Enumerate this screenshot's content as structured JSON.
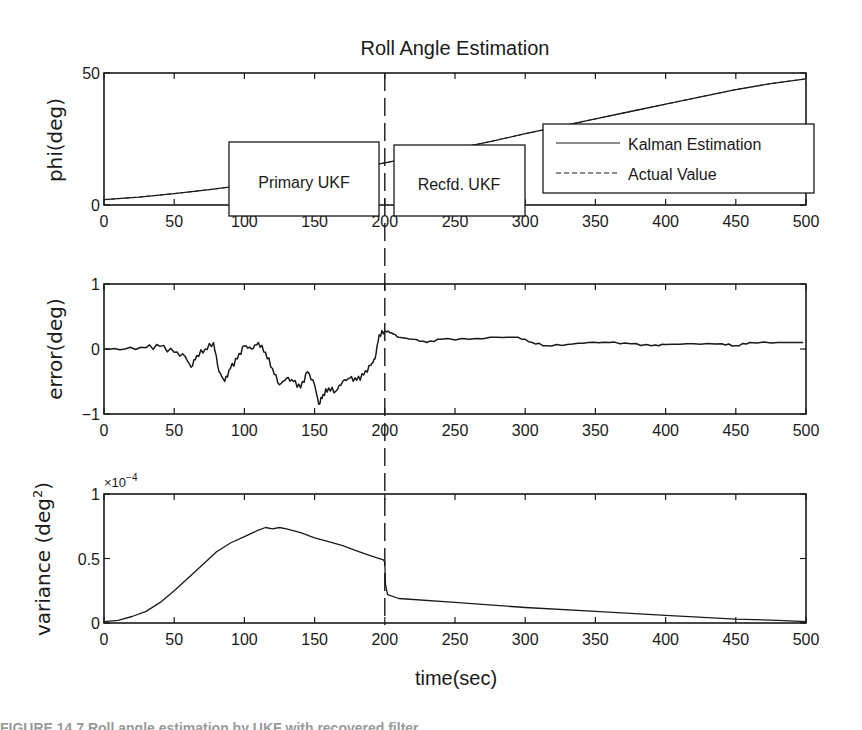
{
  "chart_data": [
    {
      "type": "line",
      "title": "Roll Angle Estimation",
      "xlabel": "",
      "ylabel": "phi(deg)",
      "xlim": [
        0,
        500
      ],
      "ylim": [
        0,
        50
      ],
      "xticks": [
        0,
        50,
        100,
        150,
        200,
        250,
        300,
        350,
        400,
        450,
        500
      ],
      "yticks": [
        0,
        50
      ],
      "grid": false,
      "legend": {
        "position": "right-center",
        "entries": [
          {
            "label": "Kalman Estimation",
            "style": "solid"
          },
          {
            "label": "Actual Value",
            "style": "dashed"
          }
        ]
      },
      "annotations": [
        {
          "text": "Primary UKF",
          "x_range": [
            90,
            195
          ],
          "y_range": [
            28,
            43
          ]
        },
        {
          "text": "Recfd. UKF",
          "x_range": [
            205,
            297
          ],
          "y_range": [
            28,
            42
          ]
        }
      ],
      "vline": {
        "x": 200,
        "style": "dashed"
      },
      "series": [
        {
          "name": "Kalman Estimation",
          "x": [
            0,
            25,
            50,
            75,
            100,
            125,
            150,
            175,
            200,
            225,
            250,
            275,
            300,
            325,
            350,
            375,
            400,
            425,
            450,
            475,
            500
          ],
          "values": [
            2,
            3,
            4.3,
            5.8,
            7.5,
            9.3,
            11.2,
            13.4,
            16,
            18.6,
            21.3,
            24,
            27,
            29.8,
            32.6,
            35.4,
            38.2,
            41,
            43.7,
            46,
            47.8
          ]
        }
      ]
    },
    {
      "type": "line",
      "title": "",
      "xlabel": "",
      "ylabel": "error(deg)",
      "xlim": [
        0,
        500
      ],
      "ylim": [
        -1,
        1
      ],
      "xticks": [
        0,
        50,
        100,
        150,
        200,
        250,
        300,
        350,
        400,
        450,
        500
      ],
      "yticks": [
        -1,
        0,
        1
      ],
      "grid": false,
      "vline": {
        "x": 200,
        "style": "dashed"
      },
      "series": [
        {
          "name": "error",
          "x": [
            0,
            15,
            30,
            40,
            50,
            58,
            62,
            66,
            72,
            78,
            82,
            86,
            90,
            95,
            100,
            105,
            110,
            115,
            120,
            125,
            130,
            135,
            140,
            145,
            150,
            153,
            156,
            160,
            165,
            170,
            175,
            180,
            185,
            190,
            193,
            196,
            200,
            205,
            210,
            220,
            230,
            240,
            260,
            280,
            295,
            305,
            315,
            330,
            345,
            360,
            375,
            390,
            400,
            420,
            440,
            450,
            460,
            480,
            498
          ],
          "values": [
            0,
            0,
            0.02,
            0.04,
            -0.05,
            -0.12,
            -0.28,
            -0.1,
            0.0,
            0.1,
            -0.35,
            -0.5,
            -0.3,
            -0.15,
            0.05,
            0.0,
            0.1,
            -0.05,
            -0.3,
            -0.55,
            -0.45,
            -0.5,
            -0.6,
            -0.35,
            -0.55,
            -0.85,
            -0.7,
            -0.6,
            -0.65,
            -0.5,
            -0.45,
            -0.48,
            -0.4,
            -0.25,
            -0.15,
            0.22,
            0.28,
            0.25,
            0.18,
            0.15,
            0.1,
            0.15,
            0.15,
            0.18,
            0.18,
            0.1,
            0.05,
            0.07,
            0.1,
            0.1,
            0.08,
            0.05,
            0.07,
            0.08,
            0.08,
            0.05,
            0.1,
            0.1,
            0.1
          ]
        }
      ]
    },
    {
      "type": "line",
      "title": "",
      "xlabel": "time(sec)",
      "ylabel": "variance (deg2)",
      "y_multiplier": "×10-4",
      "xlim": [
        0,
        500
      ],
      "ylim": [
        0,
        1
      ],
      "xticks": [
        0,
        50,
        100,
        150,
        200,
        250,
        300,
        350,
        400,
        450,
        500
      ],
      "yticks": [
        0,
        0.5,
        1
      ],
      "grid": false,
      "vline": {
        "x": 200,
        "style": "dashed"
      },
      "series": [
        {
          "name": "variance",
          "x": [
            0,
            10,
            20,
            30,
            40,
            50,
            60,
            70,
            80,
            90,
            100,
            110,
            115,
            120,
            125,
            130,
            140,
            150,
            160,
            170,
            180,
            190,
            199,
            200,
            200.5,
            202,
            210,
            250,
            300,
            350,
            400,
            450,
            480,
            500
          ],
          "values": [
            0.01,
            0.02,
            0.05,
            0.09,
            0.16,
            0.25,
            0.35,
            0.45,
            0.55,
            0.62,
            0.67,
            0.72,
            0.74,
            0.73,
            0.74,
            0.73,
            0.7,
            0.66,
            0.63,
            0.6,
            0.56,
            0.52,
            0.49,
            0.47,
            0.3,
            0.22,
            0.19,
            0.16,
            0.12,
            0.09,
            0.06,
            0.03,
            0.02,
            0.01
          ]
        }
      ]
    }
  ],
  "figure": {
    "title": "Roll Angle Estimation",
    "panels": [
      {
        "ylabel": "phi(deg)",
        "yticklabels": [
          "0",
          "50"
        ]
      },
      {
        "ylabel": "error(deg)",
        "yticklabels": [
          "−1",
          "0",
          "1"
        ]
      },
      {
        "ylabel_main": "variance (deg",
        "ylabel_sup": "2",
        "ylabel_end": ")",
        "yticklabels": [
          "0",
          "0.5",
          "1"
        ],
        "exponent_base": "×10",
        "exponent_power": "−4"
      }
    ],
    "xticklabels": [
      "0",
      "50",
      "100",
      "150",
      "200",
      "250",
      "300",
      "350",
      "400",
      "450",
      "500"
    ],
    "xlabel": "time(sec)",
    "legend": {
      "solid_label": "Kalman Estimation",
      "dashed_label": "Actual Value"
    },
    "annotation_primary": "Primary UKF",
    "annotation_recfd": "Recfd. UKF",
    "caption": "FIGURE 14.7   Roll angle estimation by UKF with recovered filter"
  }
}
